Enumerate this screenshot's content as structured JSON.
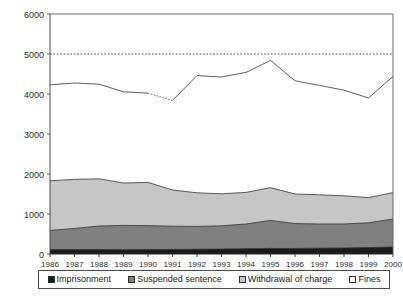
{
  "chart_data": {
    "type": "area",
    "title": "",
    "subtitle": "",
    "xlabel": "",
    "ylabel": "",
    "stacked": true,
    "grid": false,
    "legend_position": "bottom",
    "categories": [
      "1986",
      "1987",
      "1988",
      "1989",
      "1990",
      "1991",
      "1992",
      "1993",
      "1994",
      "1995",
      "1996",
      "1997",
      "1998",
      "1999",
      "2000"
    ],
    "xlim": [
      "1986",
      "2000"
    ],
    "ylim": [
      0,
      6000
    ],
    "ytick_values": [
      0,
      1000,
      2000,
      3000,
      4000,
      5000,
      6000
    ],
    "ytick_labels": [
      "0",
      "1000",
      "2000",
      "3000",
      "4000",
      "5000",
      "6000"
    ],
    "reference_line": {
      "value": 5000,
      "style": "dotted"
    },
    "series": [
      {
        "name": "Imprisonment",
        "color": "#1a1a1a",
        "values": [
          110,
          110,
          110,
          105,
          110,
          115,
          120,
          125,
          130,
          140,
          140,
          145,
          150,
          160,
          175
        ]
      },
      {
        "name": "Suspended sentence",
        "color": "#808080",
        "values": [
          480,
          530,
          590,
          610,
          600,
          580,
          570,
          580,
          620,
          700,
          620,
          605,
          600,
          620,
          700
        ]
      },
      {
        "name": "Withdrawal of charge",
        "color": "#c6c6c6",
        "values": [
          1240,
          1225,
          1180,
          1060,
          1080,
          905,
          840,
          800,
          790,
          820,
          740,
          730,
          705,
          630,
          660
        ]
      },
      {
        "name": "Fines",
        "color": "#ffffff",
        "values": [
          2400,
          2410,
          2365,
          2280,
          2230,
          2240,
          2930,
          2920,
          3000,
          3180,
          2830,
          2735,
          2640,
          2490,
          2905
        ]
      }
    ],
    "totals": [
      4230,
      4275,
      4245,
      4055,
      4020,
      3840,
      4460,
      4425,
      4540,
      4840,
      4330,
      4215,
      4095,
      3900,
      4440
    ],
    "total_line_color": "#4a4a4a",
    "dashed_segment": {
      "from": "1990",
      "to": "1991"
    }
  },
  "legend": {
    "items": [
      {
        "label": "Imprisonment",
        "color": "#1a1a1a"
      },
      {
        "label": "Suspended sentence",
        "color": "#808080"
      },
      {
        "label": "Withdrawal of charge",
        "color": "#c6c6c6"
      },
      {
        "label": "Fines",
        "color": "#ffffff"
      }
    ]
  }
}
